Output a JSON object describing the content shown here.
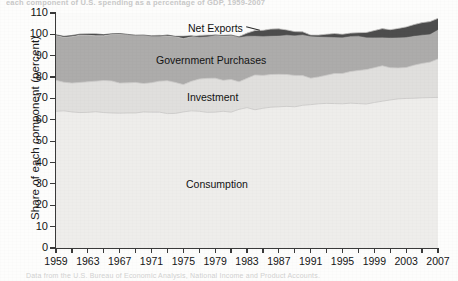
{
  "figure": {
    "ylabel": "Share of each component (percent)",
    "scan_top_text": "each component of U.S. spending as a percentage of GDP, 1959-2007",
    "scan_bottom_text": "Data from the U.S. Bureau of Economic Analysis, National Income and Product Accounts."
  },
  "axes": {
    "y_ticks": [
      "0",
      "10",
      "20",
      "30",
      "40",
      "50",
      "60",
      "70",
      "80",
      "90",
      "100",
      "110"
    ],
    "x_ticks": [
      "1959",
      "1963",
      "1967",
      "1971",
      "1975",
      "1979",
      "1983",
      "1987",
      "1991",
      "1995",
      "1999",
      "2003",
      "2007"
    ]
  },
  "labels": {
    "net_exports": "Net Exports",
    "government_purchases": "Government Purchases",
    "investment": "Investment",
    "consumption": "Consumption"
  },
  "colors": {
    "consumption": "#eeedeb",
    "investment": "#e0dfdd",
    "government_purchases": "#adacab",
    "net_exports": "#4d4d4d",
    "axis": "#3a3a3a",
    "boundary": "#c9c8c6",
    "text": "#141414"
  },
  "chart_data": {
    "type": "area",
    "title": "",
    "subtitle": "",
    "xlabel": "",
    "ylabel": "Share of each component (percent)",
    "xlim": [
      1959,
      2007
    ],
    "ylim": [
      0,
      110
    ],
    "ytick_step": 10,
    "xtick_step": 4,
    "grid": false,
    "legend": "in-plot labels",
    "stacked": true,
    "stack_order_bottom_to_top": [
      "Consumption",
      "Investment",
      "Government Purchases",
      "Net Exports"
    ],
    "x": [
      1959,
      1960,
      1961,
      1962,
      1963,
      1964,
      1965,
      1966,
      1967,
      1968,
      1969,
      1970,
      1971,
      1972,
      1973,
      1974,
      1975,
      1976,
      1977,
      1978,
      1979,
      1980,
      1981,
      1982,
      1983,
      1984,
      1985,
      1986,
      1987,
      1988,
      1989,
      1990,
      1991,
      1992,
      1993,
      1994,
      1995,
      1996,
      1997,
      1998,
      1999,
      2000,
      2001,
      2002,
      2003,
      2004,
      2005,
      2006,
      2007
    ],
    "series": [
      {
        "name": "Consumption",
        "values": [
          64.0,
          64.2,
          63.7,
          63.4,
          63.5,
          63.8,
          63.4,
          63.2,
          63.1,
          63.2,
          63.2,
          63.7,
          63.6,
          63.6,
          62.9,
          63.0,
          63.7,
          64.2,
          64.0,
          63.5,
          63.6,
          64.0,
          63.6,
          64.9,
          65.7,
          64.7,
          65.4,
          65.9,
          66.1,
          66.3,
          66.1,
          66.8,
          67.1,
          67.5,
          67.7,
          67.6,
          67.5,
          67.8,
          67.6,
          67.4,
          68.1,
          68.7,
          69.3,
          69.8,
          70.0,
          70.1,
          70.3,
          70.4,
          70.5
        ]
      },
      {
        "name": "Investment",
        "values": [
          14.5,
          13.4,
          13.5,
          14.1,
          14.3,
          14.3,
          15.0,
          15.0,
          14.1,
          14.1,
          14.3,
          13.3,
          13.8,
          14.5,
          15.4,
          14.5,
          12.8,
          13.8,
          15.1,
          15.9,
          15.9,
          14.5,
          15.3,
          12.9,
          13.7,
          16.3,
          15.4,
          15.3,
          15.2,
          14.9,
          14.7,
          13.9,
          12.4,
          12.6,
          13.2,
          14.1,
          14.2,
          14.8,
          15.5,
          16.1,
          16.3,
          16.6,
          15.1,
          14.5,
          14.5,
          15.5,
          16.1,
          16.6,
          18.0
        ]
      },
      {
        "name": "Government Purchases",
        "values": [
          21.0,
          21.0,
          21.7,
          22.1,
          21.8,
          21.2,
          20.9,
          21.8,
          22.9,
          22.7,
          22.1,
          22.5,
          22.0,
          21.5,
          20.9,
          21.4,
          21.5,
          20.8,
          20.4,
          20.3,
          20.2,
          20.6,
          20.5,
          21.2,
          21.2,
          20.8,
          21.1,
          21.3,
          21.3,
          20.9,
          20.5,
          20.5,
          20.2,
          19.6,
          19.2,
          18.7,
          18.4,
          18.0,
          17.7,
          17.4,
          17.4,
          17.4,
          17.8,
          18.5,
          19.0,
          19.0,
          19.1,
          19.0,
          19.0
        ]
      },
      {
        "name": "Net Exports",
        "values": [
          0.3,
          0.5,
          0.6,
          0.5,
          0.6,
          0.9,
          0.6,
          0.3,
          0.3,
          0.0,
          0.0,
          0.2,
          -0.1,
          -0.3,
          0.5,
          0.2,
          1.1,
          0.5,
          -0.6,
          -0.6,
          0.0,
          0.4,
          0.3,
          -0.2,
          -1.3,
          -2.4,
          -2.7,
          -3.1,
          -3.1,
          -2.3,
          -1.7,
          -1.3,
          -0.5,
          -0.7,
          -1.2,
          -1.6,
          -1.4,
          -1.4,
          -1.5,
          -2.2,
          -3.2,
          -4.0,
          -3.7,
          -4.2,
          -4.7,
          -5.2,
          -5.7,
          -5.8,
          -5.2
        ]
      }
    ],
    "annotations": [
      {
        "text": "Net Exports",
        "x": 1983,
        "y": 104
      },
      {
        "text": "Government Purchases",
        "x": 1978,
        "y": 90
      },
      {
        "text": "Investment",
        "x": 1983,
        "y": 74
      },
      {
        "text": "Consumption",
        "x": 1983,
        "y": 31
      }
    ]
  }
}
